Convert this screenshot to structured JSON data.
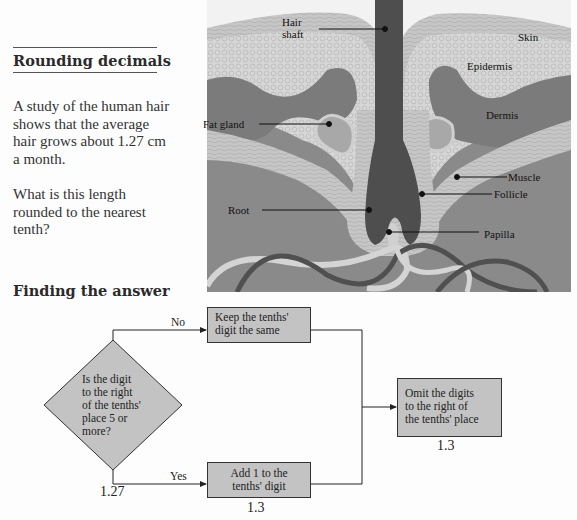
{
  "lesson": {
    "title": "Rounding decimals",
    "paragraph1": [
      "A study of the human hair",
      "shows that the average",
      "hair grows about 1.27 cm",
      "a month."
    ],
    "paragraph2": [
      "What is this length",
      "rounded to the nearest",
      "tenth?"
    ],
    "section_heading": "Finding the answer"
  },
  "illustration": {
    "labels": {
      "hair_shaft": [
        "Hair",
        "shaft"
      ],
      "skin": "Skin",
      "epidermis": "Epidermis",
      "dermis": "Dermis",
      "fat_gland": "Fat gland",
      "muscle": "Muscle",
      "follicle": "Follicle",
      "root": "Root",
      "papilla": "Papilla"
    },
    "colors": {
      "background": "#8a8a8a",
      "skin": "#c8c8c8",
      "epidermis": "#d9d9d9",
      "dermis": "#7d7d7d",
      "hair": "#4e4e4e",
      "follicle": "#cfcfcf",
      "vessel_light": "#d4d4d4",
      "vessel_dark": "#505050"
    }
  },
  "flowchart": {
    "decision": [
      "Is the digit",
      "to the right",
      "of the tenths'",
      "place 5 or",
      "more?"
    ],
    "start_value": "1.27",
    "no_label": "No",
    "yes_label": "Yes",
    "keep_box": [
      "Keep the tenths'",
      "digit the same"
    ],
    "add_box": [
      "Add 1 to the",
      "tenths' digit"
    ],
    "add_value": "1.3",
    "omit_box": [
      "Omit the digits",
      "to the right of",
      "the tenths' place"
    ],
    "omit_value": "1.3",
    "colors": {
      "box_fill": "#c3c3c3",
      "line": "#222222"
    }
  }
}
